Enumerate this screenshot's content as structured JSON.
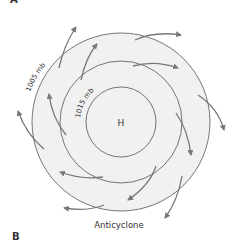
{
  "panels": {
    "top_label": "A",
    "bottom_label": "B"
  },
  "diagram": {
    "title": "Anticyclone",
    "center_label": "H",
    "isobars": [
      {
        "label": "1015 mb",
        "radius": 35
      },
      {
        "label": "1005 mb",
        "radius": 61
      },
      {
        "label": "",
        "radius": 89
      }
    ],
    "colors": {
      "fill": "#f1f1f1",
      "line": "#555555",
      "arrow": "#777777",
      "text": "#333333"
    },
    "airflow": "clockwise outward spiral"
  }
}
